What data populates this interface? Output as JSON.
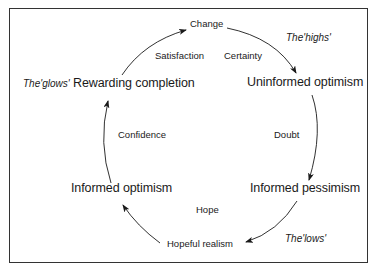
{
  "diagram": {
    "type": "cycle",
    "stages": [
      {
        "id": "change",
        "label": "Change"
      },
      {
        "id": "uninformed-optimism",
        "label": "Uninformed optimism"
      },
      {
        "id": "informed-pessimism",
        "label": "Informed pessimism"
      },
      {
        "id": "hopeful-realism",
        "label": "Hopeful realism"
      },
      {
        "id": "informed-optimism",
        "label": "Informed optimism"
      },
      {
        "id": "rewarding-completion",
        "label": "Rewarding completion"
      }
    ],
    "emotions": [
      {
        "id": "certainty",
        "label": "Certainty"
      },
      {
        "id": "doubt",
        "label": "Doubt"
      },
      {
        "id": "hope",
        "label": "Hope"
      },
      {
        "id": "confidence",
        "label": "Confidence"
      },
      {
        "id": "satisfaction",
        "label": "Satisfaction"
      }
    ],
    "annotations": {
      "highs": "The'highs'",
      "lows": "The'lows'",
      "glows": "The'glows'"
    },
    "colors": {
      "ink": "#1a1a1a",
      "background": "#ffffff"
    }
  }
}
